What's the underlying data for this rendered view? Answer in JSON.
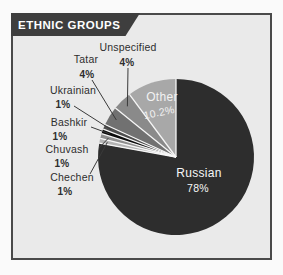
{
  "page": {
    "background": "#fafafa"
  },
  "panel": {
    "title": "ETHNIC GROUPS",
    "title_color": "#ffffff",
    "tab_color": "#3e3e3e",
    "background": "#eaeaea",
    "border_color": "#4a4a4a"
  },
  "chart_data": {
    "type": "pie",
    "title": "ETHNIC GROUPS",
    "unit": "percent",
    "direction": "clockwise",
    "start_angle_deg": 0,
    "center": {
      "x": 176,
      "y": 157
    },
    "radius": 78,
    "separator_color": "#f6f6f6",
    "callout_line_color": "#3a3a3a",
    "callout_text_color": "#2e2e2e",
    "slices": [
      {
        "label": "Russian",
        "value": 78,
        "value_label": "78%",
        "color": "#2d2d2d",
        "inner_label": {
          "x": 199,
          "y": 173,
          "pct_x": 198,
          "pct_y": 188,
          "pct_rotate": 0,
          "color": "#f7f7f7"
        }
      },
      {
        "label": "Chechen",
        "value": 1,
        "value_label": "1%",
        "color": "#b4b4b4",
        "callout": {
          "label_x": 72,
          "label_y": 177,
          "pct_x": 65,
          "pct_y": 191,
          "line_x1": 90,
          "line_y1": 174
        }
      },
      {
        "label": "Chuvash",
        "value": 1,
        "value_label": "1%",
        "color": "#8e8e8e",
        "callout": {
          "label_x": 67,
          "label_y": 149,
          "pct_x": 62,
          "pct_y": 163,
          "line_x1": 99,
          "line_y1": 148
        }
      },
      {
        "label": "Bashkir",
        "value": 1,
        "value_label": "1%",
        "color": "#0c0c0c",
        "callout": {
          "label_x": 69,
          "label_y": 122,
          "pct_x": 60,
          "pct_y": 136,
          "line_x1": 91,
          "line_y1": 127
        }
      },
      {
        "label": "Ukrainian",
        "value": 1,
        "value_label": "1%",
        "color": "#4e4e4e",
        "callout": {
          "label_x": 73,
          "label_y": 90,
          "pct_x": 63,
          "pct_y": 104,
          "line_x1": 74,
          "line_y1": 106
        }
      },
      {
        "label": "Tatar",
        "value": 4,
        "value_label": "4%",
        "color": "#717171",
        "callout": {
          "label_x": 86,
          "label_y": 59,
          "pct_x": 87,
          "pct_y": 74,
          "line_x1": 92,
          "line_y1": 80
        }
      },
      {
        "label": "Unspecified",
        "value": 4,
        "value_label": "4%",
        "color": "#8a8a8a",
        "callout": {
          "label_x": 128,
          "label_y": 47,
          "pct_x": 127,
          "pct_y": 62,
          "line_x1": 128,
          "line_y1": 68
        }
      },
      {
        "label": "Other",
        "value": 10.2,
        "value_label": "10.2%",
        "color": "#a8a8a8",
        "inner_label": {
          "x": 162,
          "y": 97,
          "pct_x": 159,
          "pct_y": 112,
          "pct_rotate": -12,
          "color": "#f2f2f2"
        }
      }
    ]
  }
}
